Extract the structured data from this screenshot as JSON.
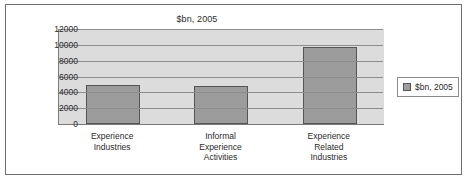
{
  "chart_data": {
    "type": "bar",
    "title": "$bn, 2005",
    "xlabel": "",
    "ylabel": "",
    "categories": [
      "Experience Industries",
      "Informal Experience Activities",
      "Experience Related Industries"
    ],
    "category_lines": [
      [
        "Experience",
        "Industries"
      ],
      [
        "Informal",
        "Experience",
        "Activities"
      ],
      [
        "Experience",
        "Related",
        "Industries"
      ]
    ],
    "series": [
      {
        "name": "$bn, 2005",
        "values": [
          4900,
          4800,
          9700
        ]
      }
    ],
    "values": [
      4900,
      4800,
      9700
    ],
    "ylim": [
      0,
      12000
    ],
    "ytick_values": [
      12000,
      10000,
      8000,
      6000,
      4000,
      2000,
      0
    ],
    "ytick_labels": [
      "12000",
      "10000",
      "8000",
      "6000",
      "4000",
      "2000",
      "0"
    ],
    "grid": true,
    "legend": {
      "position": "right",
      "entries": [
        "$bn, 2005"
      ]
    },
    "colors": {
      "bar_fill": "#9c9c9c",
      "bar_border": "#555555",
      "plot_background": "#dcdcdc",
      "gridline": "#8d8d8d",
      "text": "#2b2b2b"
    }
  }
}
